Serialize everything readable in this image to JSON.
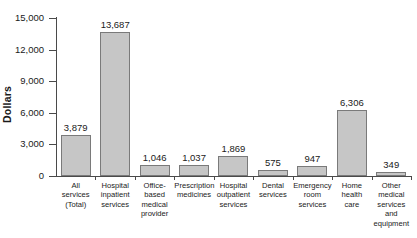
{
  "chart_data": {
    "type": "bar",
    "title": "",
    "xlabel": "",
    "ylabel": "Dollars",
    "ylim": [
      0,
      15000
    ],
    "grid": false,
    "legend": false,
    "y_ticks": [
      {
        "value": 15000,
        "label": "15,000"
      },
      {
        "value": 12000,
        "label": "12,000"
      },
      {
        "value": 9000,
        "label": "9,000"
      },
      {
        "value": 6000,
        "label": "6,000"
      },
      {
        "value": 3000,
        "label": "3,000"
      },
      {
        "value": 0,
        "label": "0"
      }
    ],
    "categories": [
      "All\nservices\n(Total)",
      "Hospital\ninpatient\nservices",
      "Office-\nbased\nmedical\nprovider",
      "Prescription\nmedicines",
      "Hospital\noutpatient\nservices",
      "Dental\nservices",
      "Emergency\nroom\nservices",
      "Home\nhealth\ncare",
      "Other\nmedical\nservices\nand\nequipment"
    ],
    "values": [
      3879,
      13687,
      1046,
      1037,
      1869,
      575,
      947,
      6306,
      349
    ],
    "value_labels": [
      "3,879",
      "13,687",
      "1,046",
      "1,037",
      "1,869",
      "575",
      "947",
      "6,306",
      "349"
    ],
    "bar_fill": "#c6c6c6",
    "bar_stroke": "#7a7a7a",
    "axis_color": "#4a4a4a"
  }
}
